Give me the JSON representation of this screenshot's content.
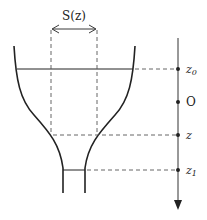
{
  "diagram": {
    "labels": {
      "area": "S(z)",
      "z0": "z",
      "z0_sub": "0",
      "origin": "O",
      "z": "z",
      "z1": "z",
      "z1_sub": "1"
    },
    "axis": {
      "direction": "down",
      "ticks": [
        "z0",
        "O",
        "z",
        "z1"
      ]
    },
    "colors": {
      "stroke": "#222222",
      "dash": "#555555",
      "background": "#ffffff"
    }
  }
}
